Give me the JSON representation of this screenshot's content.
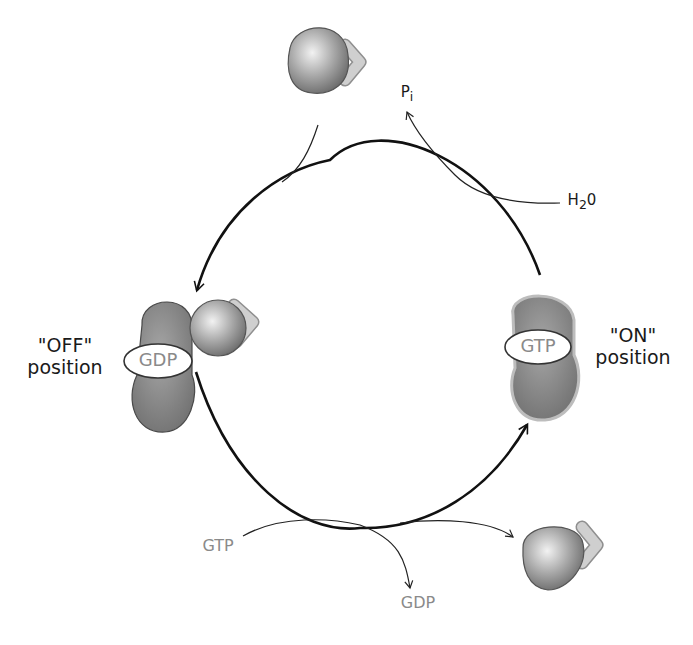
{
  "diagram": {
    "type": "cycle",
    "title": "",
    "states": {
      "off": {
        "line1": "\"OFF\"",
        "line2": "position",
        "nucleotide": "GDP"
      },
      "on": {
        "line1": "\"ON\"",
        "line2": "position",
        "nucleotide": "GTP"
      }
    },
    "inputs_outputs": {
      "top_output": "Pi",
      "top_output_base": "P",
      "top_output_sub": "i",
      "top_input": "H2O",
      "top_input_base": "H",
      "top_input_sub": "2",
      "top_input_tail": "0",
      "bottom_input": "GTP",
      "bottom_output": "GDP"
    },
    "colors": {
      "protein_fill": "#8c8c8c",
      "protein_highlight": "#d9d9d9",
      "chevron": "#c8c8c8",
      "arrow": "#111111",
      "nucleotide_label": "#8a8a8a",
      "on_outline": "#b8b8b8"
    }
  }
}
